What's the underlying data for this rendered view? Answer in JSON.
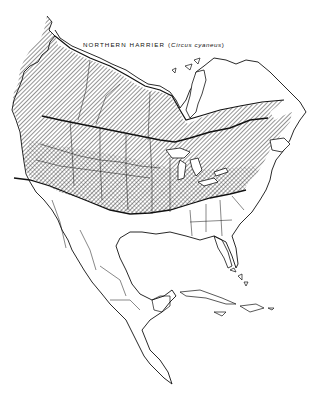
{
  "map": {
    "title_common": "NORTHERN HARRIER",
    "title_open": " (",
    "title_scientific": "Circus cyaneus",
    "title_close": ")",
    "region": "North America",
    "legend": {
      "breeding_range": "hatched",
      "year_round_range": "cross-hatched",
      "winter_boundary": "thick line"
    },
    "colors": {
      "ink": "#111111",
      "background": "#ffffff"
    }
  }
}
